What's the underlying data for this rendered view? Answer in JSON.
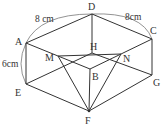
{
  "diagram": {
    "type": "cuboid",
    "vertices": {
      "A": {
        "x": 26,
        "y": 43,
        "lx": 15,
        "ly": 45
      },
      "B": {
        "x": 90,
        "y": 69,
        "lx": 92,
        "ly": 80
      },
      "C": {
        "x": 152,
        "y": 39,
        "lx": 150,
        "ly": 34
      },
      "D": {
        "x": 92,
        "y": 14,
        "lx": 88,
        "ly": 10
      },
      "E": {
        "x": 26,
        "y": 84,
        "lx": 15,
        "ly": 96
      },
      "F": {
        "x": 89,
        "y": 111,
        "lx": 85,
        "ly": 124
      },
      "G": {
        "x": 152,
        "y": 75,
        "lx": 153,
        "ly": 86
      },
      "H": {
        "x": 92,
        "y": 53,
        "lx": 90,
        "ly": 50
      },
      "M": {
        "x": 58,
        "y": 56,
        "lx": 45,
        "ly": 61
      },
      "N": {
        "x": 121,
        "y": 54,
        "lx": 123,
        "ly": 62
      }
    },
    "labels": {
      "A": "A",
      "B": "B",
      "C": "C",
      "D": "D",
      "E": "E",
      "F": "F",
      "G": "G",
      "H": "H",
      "M": "M",
      "N": "N"
    },
    "dimensions": {
      "AD": "8 cm",
      "DC": "8cm",
      "AE": "6cm"
    },
    "edges": [
      [
        "A",
        "D"
      ],
      [
        "D",
        "C"
      ],
      [
        "C",
        "B"
      ],
      [
        "B",
        "A"
      ],
      [
        "A",
        "E"
      ],
      [
        "B",
        "F"
      ],
      [
        "C",
        "G"
      ],
      [
        "D",
        "H"
      ],
      [
        "E",
        "F"
      ],
      [
        "F",
        "G"
      ],
      [
        "E",
        "H"
      ],
      [
        "H",
        "G"
      ],
      [
        "M",
        "N"
      ],
      [
        "M",
        "F"
      ],
      [
        "N",
        "F"
      ]
    ],
    "colors": {
      "line": "#333333",
      "arc": "#777777"
    }
  }
}
